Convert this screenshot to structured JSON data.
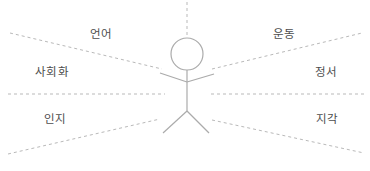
{
  "diagram": {
    "labels": {
      "top_left": "언어",
      "top_right": "운동",
      "mid_left": "사회화",
      "mid_right": "정서",
      "bottom_left": "인지",
      "bottom_right": "지각"
    },
    "icons": {
      "center_figure": "child-stick-figure"
    }
  },
  "colors": {
    "background": "#ffffff",
    "dashed_line": "#b9b9b9",
    "figure_stroke": "#ababab",
    "label_text": "#4d4d4d"
  }
}
